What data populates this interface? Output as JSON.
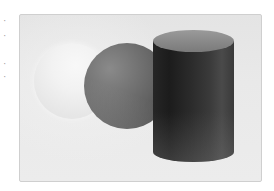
{
  "figure": {
    "objects": [
      {
        "type": "sphere",
        "shade": "light",
        "color": "#f2f2f2"
      },
      {
        "type": "sphere",
        "shade": "medium-dark",
        "color": "#6e6e6e"
      },
      {
        "type": "cylinder",
        "shade": "dark",
        "body_color": "#262626",
        "top_color": "#8a8a8a"
      }
    ],
    "background_color": "#e8e8e8",
    "frame_border_color": "#cfcfcf"
  },
  "edge_fragments": [
    "·",
    "·",
    "·",
    "·"
  ]
}
